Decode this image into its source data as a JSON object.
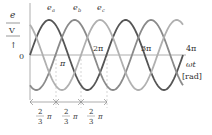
{
  "figure": {
    "type": "three-phase sinusoidal waveforms",
    "y_axis": {
      "label_top": "e",
      "label_unit": "V",
      "origin": "0"
    },
    "x_axis": {
      "label": "ωt",
      "unit": "[rad]",
      "ticks": [
        "π",
        "2π",
        "3π",
        "4π"
      ]
    },
    "curves": [
      {
        "name": "e_a",
        "label": "e",
        "sub": "a",
        "phase_deg": 0,
        "color": "#555555"
      },
      {
        "name": "e_b",
        "label": "e",
        "sub": "b",
        "phase_deg": -120,
        "color": "#8a8a8a"
      },
      {
        "name": "e_c",
        "label": "e",
        "sub": "c",
        "phase_deg": -240,
        "color": "#b0b0b0"
      }
    ],
    "spacing": [
      {
        "num": "2",
        "den": "3",
        "sym": "π"
      },
      {
        "num": "2",
        "den": "3",
        "sym": "π"
      },
      {
        "num": "2",
        "den": "3",
        "sym": "π"
      }
    ]
  }
}
